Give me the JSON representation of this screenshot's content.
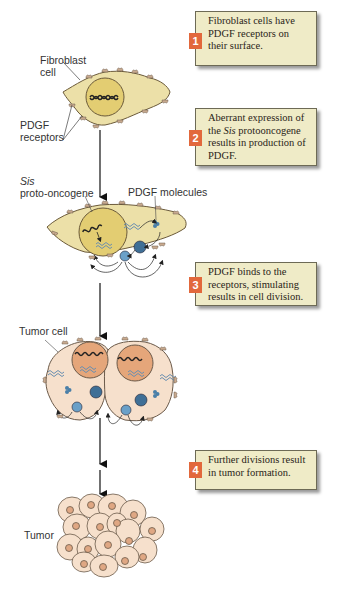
{
  "labels": {
    "fibroblast_cell_1": "Fibroblast",
    "fibroblast_cell_2": "cell",
    "pdgf_receptors_1": "PDGF",
    "pdgf_receptors_2": "receptors",
    "sis_1": "Sis",
    "sis_2": "proto-oncogene",
    "pdgf_molecules": "PDGF molecules",
    "tumor_cell": "Tumor cell",
    "tumor": "Tumor"
  },
  "steps": [
    {
      "number": "1",
      "text": "Fibroblast cells have PDGF receptors on their surface."
    },
    {
      "number": "2",
      "text_parts": [
        "Aberrant expression of the ",
        "Sis",
        " protooncogene results in production of PDGF."
      ]
    },
    {
      "number": "3",
      "text": "PDGF binds to the receptors, stimulating results in cell division."
    },
    {
      "number": "4",
      "text": "Further divisions result in tumor formation."
    }
  ],
  "colors": {
    "step_box_bg": "#efebc7",
    "step_number_bg": "#e2683c",
    "fibroblast_fill": "#ece0a8",
    "nucleus_fill": "#e3cd72",
    "tumor_cell_fill": "#f6e0cc",
    "tumor_nucleus_fill": "#e5a67a",
    "pdgf_blue": "#4a7fa8"
  }
}
